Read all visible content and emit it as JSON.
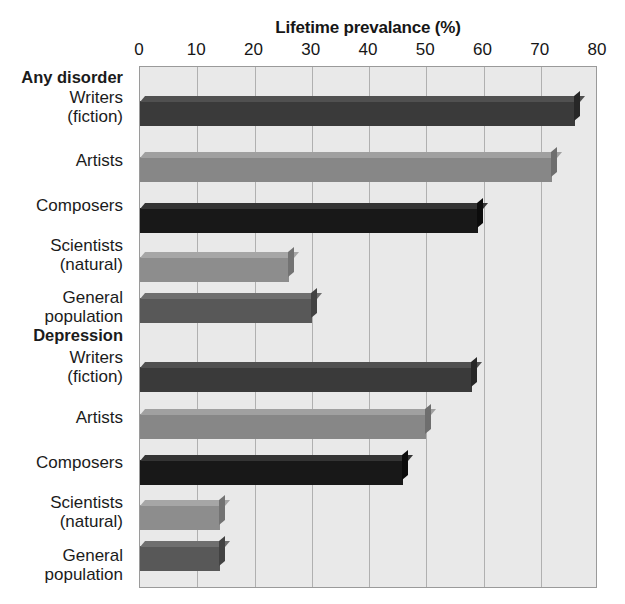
{
  "chart_data": {
    "type": "bar",
    "orientation": "horizontal",
    "title": "Lifetime prevalance (%)",
    "xlabel": "Lifetime prevalance (%)",
    "ylabel": "",
    "xlim": [
      0,
      80
    ],
    "xticks": [
      0,
      10,
      20,
      30,
      40,
      50,
      60,
      70,
      80
    ],
    "xtick_labels": [
      "0",
      "10",
      "20",
      "30",
      "40",
      "50",
      "60",
      "70",
      "80"
    ],
    "grid": true,
    "legend": false,
    "groups": [
      {
        "name": "Any disorder",
        "categories": [
          "Writers\n(fiction)",
          "Artists",
          "Composers",
          "Scientists\n(natural)",
          "General\npopulation"
        ],
        "values": [
          76,
          72,
          59,
          26,
          30
        ]
      },
      {
        "name": "Depression",
        "categories": [
          "Writers\n(fiction)",
          "Artists",
          "Composers",
          "Scientists\n(natural)",
          "General\npopulation"
        ],
        "values": [
          58,
          50,
          46,
          14,
          14
        ]
      }
    ],
    "bars": [
      {
        "group": "Any disorder",
        "label": "Writers\n(fiction)",
        "value": 76,
        "color": "#3a3a3a",
        "top_color": "#505050",
        "side_color": "#272727"
      },
      {
        "group": "Any disorder",
        "label": "Artists",
        "value": 72,
        "color": "#878787",
        "top_color": "#a0a0a0",
        "side_color": "#6e6e6e"
      },
      {
        "group": "Any disorder",
        "label": "Composers",
        "value": 59,
        "color": "#181818",
        "top_color": "#343434",
        "side_color": "#0c0c0c"
      },
      {
        "group": "Any disorder",
        "label": "Scientists\n(natural)",
        "value": 26,
        "color": "#8d8d8d",
        "top_color": "#a6a6a6",
        "side_color": "#737373"
      },
      {
        "group": "Any disorder",
        "label": "General\npopulation",
        "value": 30,
        "color": "#585858",
        "top_color": "#6f6f6f",
        "side_color": "#424242"
      },
      {
        "group": "Depression",
        "label": "Writers\n(fiction)",
        "value": 58,
        "color": "#3a3a3a",
        "top_color": "#505050",
        "side_color": "#272727"
      },
      {
        "group": "Depression",
        "label": "Artists",
        "value": 50,
        "color": "#878787",
        "top_color": "#a0a0a0",
        "side_color": "#6e6e6e"
      },
      {
        "group": "Depression",
        "label": "Composers",
        "value": 46,
        "color": "#181818",
        "top_color": "#343434",
        "side_color": "#0c0c0c"
      },
      {
        "group": "Depression",
        "label": "Scientists\n(natural)",
        "value": 14,
        "color": "#8d8d8d",
        "top_color": "#a6a6a6",
        "side_color": "#737373"
      },
      {
        "group": "Depression",
        "label": "General\npopulation",
        "value": 14,
        "color": "#585858",
        "top_color": "#6f6f6f",
        "side_color": "#424242"
      }
    ],
    "colors": {
      "plot_background": "#e9e9e9",
      "gridline": "#b0b0b0",
      "axis_border": "#9a9a9a",
      "text": "#161616",
      "page_background": "#ffffff"
    }
  }
}
